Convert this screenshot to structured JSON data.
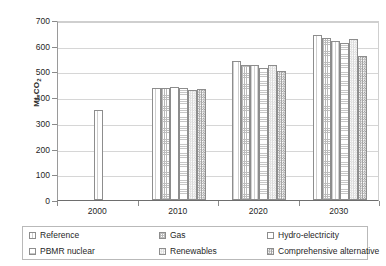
{
  "chart_data": {
    "type": "bar",
    "title": "",
    "xlabel": "",
    "ylabel": "Mt-CO2",
    "ylabel_base": "Mt-CO",
    "ylabel_sub": "2",
    "categories": [
      "2000",
      "2010",
      "2020",
      "2030"
    ],
    "ylim": [
      0,
      700
    ],
    "yticks": [
      0,
      100,
      200,
      300,
      400,
      500,
      600,
      700
    ],
    "ytick_labels": [
      "0",
      "100",
      "200",
      "300",
      "400",
      "500",
      "600",
      "700"
    ],
    "grid": true,
    "legend_position": "bottom",
    "series": [
      {
        "name": "Reference",
        "pattern": "pat-reference",
        "values": [
          350,
          437,
          540,
          640
        ]
      },
      {
        "name": "Gas",
        "pattern": "pat-gas",
        "values": [
          null,
          437,
          527,
          630
        ]
      },
      {
        "name": "Hydro-electricity",
        "pattern": "pat-hydro",
        "values": [
          null,
          438,
          525,
          620
        ]
      },
      {
        "name": "PBMR nuclear",
        "pattern": "pat-pbmr",
        "values": [
          null,
          437,
          515,
          610
        ]
      },
      {
        "name": "Renewables",
        "pattern": "pat-renewables",
        "values": [
          null,
          428,
          527,
          625
        ]
      },
      {
        "name": "Comprehensive alternative",
        "pattern": "pat-comprehensive",
        "values": [
          null,
          430,
          500,
          560
        ]
      }
    ]
  },
  "legend": {
    "items": [
      {
        "label": "Reference",
        "pattern": "pat-reference"
      },
      {
        "label": "Gas",
        "pattern": "pat-gas"
      },
      {
        "label": "Hydro-electricity",
        "pattern": "pat-hydro"
      },
      {
        "label": "PBMR nuclear",
        "pattern": "pat-pbmr"
      },
      {
        "label": "Renewables",
        "pattern": "pat-renewables"
      },
      {
        "label": "Comprehensive alternative",
        "pattern": "pat-comprehensive"
      }
    ]
  },
  "colors": {
    "axis": "#6e6e6e",
    "grid": "#d6d6d6",
    "bar_outline": "#8d8d8d",
    "text": "#1f1f1f",
    "background": "#ffffff"
  }
}
